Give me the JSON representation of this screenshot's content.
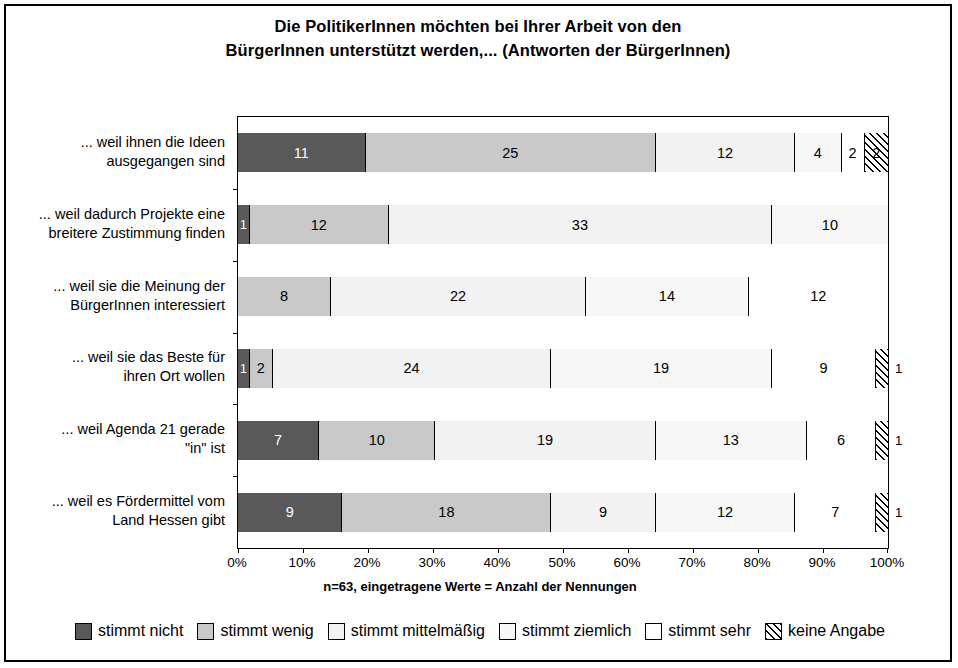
{
  "chart": {
    "title_line1": "Die PolitikerInnen möchten bei Ihrer Arbeit von den",
    "title_line2": "BürgerInnen unterstützt werden,... (Antworten der BürgerInnen)",
    "xnote": "n=63, eingetragene Werte = Anzahl der Nennungen"
  },
  "chart_data": {
    "type": "bar",
    "orientation": "horizontal",
    "stacked": true,
    "normalized": true,
    "title": "Die PolitikerInnen möchten bei Ihrer Arbeit von den BürgerInnen unterstützt werden,... (Antworten der BürgerInnen)",
    "xlabel": "n=63, eingetragene Werte = Anzahl der Nennungen",
    "ylabel": "",
    "xlim": [
      0,
      100
    ],
    "xticks": [
      "0%",
      "10%",
      "20%",
      "30%",
      "40%",
      "50%",
      "60%",
      "70%",
      "80%",
      "90%",
      "100%"
    ],
    "grid": false,
    "legend_position": "bottom",
    "series": [
      {
        "name": "stimmt nicht",
        "values": [
          11,
          1,
          0,
          1,
          7,
          9
        ]
      },
      {
        "name": "stimmt wenig",
        "values": [
          25,
          12,
          8,
          2,
          10,
          18
        ]
      },
      {
        "name": "stimmt mittelmäßig",
        "values": [
          12,
          33,
          22,
          24,
          19,
          9
        ]
      },
      {
        "name": "stimmt ziemlich",
        "values": [
          4,
          10,
          14,
          19,
          13,
          12
        ]
      },
      {
        "name": "stimmt sehr",
        "values": [
          2,
          0,
          12,
          9,
          6,
          7
        ]
      },
      {
        "name": "keine Angabe",
        "values": [
          2,
          0,
          0,
          1,
          1,
          1
        ]
      }
    ],
    "categories": [
      "... weil ihnen die Ideen ausgegangen sind",
      "... weil dadurch Projekte eine breitere Zustimmung finden",
      "... weil sie die Meinung der BürgerInnen interessiert",
      "... weil sie das Beste für ihren Ort wollen",
      "... weil Agenda 21 gerade \"in\" ist",
      "... weil es Fördermittel vom Land Hessen gibt"
    ]
  },
  "categories": [
    {
      "line1": "... weil ihnen die Ideen",
      "line2": "ausgegangen sind"
    },
    {
      "line1": "... weil dadurch Projekte eine",
      "line2": "breitere Zustimmung finden"
    },
    {
      "line1": "... weil sie die Meinung der",
      "line2": "BürgerInnen interessiert"
    },
    {
      "line1": "... weil sie das Beste für",
      "line2": "ihren Ort wollen"
    },
    {
      "line1": "... weil Agenda 21 gerade",
      "line2": "\"in\" ist"
    },
    {
      "line1": "... weil es Fördermittel vom",
      "line2": "Land Hessen gibt"
    }
  ],
  "xticks": [
    {
      "label": "0%"
    },
    {
      "label": "10%"
    },
    {
      "label": "20%"
    },
    {
      "label": "30%"
    },
    {
      "label": "40%"
    },
    {
      "label": "50%"
    },
    {
      "label": "60%"
    },
    {
      "label": "70%"
    },
    {
      "label": "80%"
    },
    {
      "label": "90%"
    },
    {
      "label": "100%"
    }
  ],
  "legend": [
    {
      "label": "stimmt nicht"
    },
    {
      "label": "stimmt wenig"
    },
    {
      "label": "stimmt mittelmäßig"
    },
    {
      "label": "stimmt ziemlich"
    },
    {
      "label": "stimmt sehr"
    },
    {
      "label": "keine Angabe"
    }
  ],
  "bars": [
    {
      "segments": [
        {
          "value": "11",
          "outside": false
        },
        {
          "value": "25",
          "outside": false
        },
        {
          "value": "12",
          "outside": false
        },
        {
          "value": "4",
          "outside": false
        },
        {
          "value": "2",
          "outside": false
        },
        {
          "value": "2",
          "outside": false
        }
      ]
    },
    {
      "segments": [
        {
          "value": "1",
          "outside": false
        },
        {
          "value": "12",
          "outside": false
        },
        {
          "value": "33",
          "outside": false
        },
        {
          "value": "10",
          "outside": false
        }
      ]
    },
    {
      "segments": [
        {
          "value": "8",
          "outside": false
        },
        {
          "value": "22",
          "outside": false
        },
        {
          "value": "14",
          "outside": false
        },
        {
          "value": "12",
          "outside": false
        }
      ]
    },
    {
      "segments": [
        {
          "value": "1",
          "outside": false
        },
        {
          "value": "2",
          "outside": false
        },
        {
          "value": "24",
          "outside": false
        },
        {
          "value": "19",
          "outside": false
        },
        {
          "value": "9",
          "outside": false
        },
        {
          "value": "1",
          "outside": true
        }
      ]
    },
    {
      "segments": [
        {
          "value": "7",
          "outside": false
        },
        {
          "value": "10",
          "outside": false
        },
        {
          "value": "19",
          "outside": false
        },
        {
          "value": "13",
          "outside": false
        },
        {
          "value": "6",
          "outside": false
        },
        {
          "value": "1",
          "outside": true
        }
      ]
    },
    {
      "segments": [
        {
          "value": "9",
          "outside": false
        },
        {
          "value": "18",
          "outside": false
        },
        {
          "value": "9",
          "outside": false
        },
        {
          "value": "12",
          "outside": false
        },
        {
          "value": "7",
          "outside": false
        },
        {
          "value": "1",
          "outside": true
        }
      ]
    }
  ]
}
